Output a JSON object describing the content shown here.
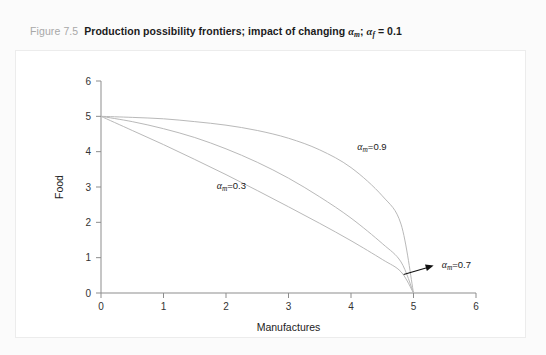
{
  "figure": {
    "number_label": "Figure 7.5",
    "caption_part1": "Production possibility frontiers; impact of changing ",
    "caption_alpha_m": "α",
    "caption_sub_m": "m",
    "caption_semicolon": "; ",
    "caption_alpha_f": "α",
    "caption_sub_f": "f",
    "caption_equals": " = 0.1"
  },
  "chart_data": {
    "type": "line",
    "title": "Production possibility frontiers; impact of changing αm; αf = 0.1",
    "xlabel": "Manufactures",
    "ylabel": "Food",
    "xlim": [
      0,
      6
    ],
    "ylim": [
      0,
      6
    ],
    "xticks": [
      0,
      1,
      2,
      3,
      4,
      5,
      6
    ],
    "yticks": [
      0,
      1,
      2,
      3,
      4,
      5,
      6
    ],
    "xtick_labels": [
      "0",
      "1",
      "2",
      "3",
      "4",
      "5",
      "6"
    ],
    "ytick_labels": [
      "0",
      "1",
      "2",
      "3",
      "4",
      "5",
      "6"
    ],
    "grid": false,
    "legend": "inline-annotations",
    "endpoints": {
      "y_intercept": 5,
      "x_intercept": 5
    },
    "series": [
      {
        "name": "αm=0.9",
        "label": "α",
        "label_sub": "m",
        "label_value": "=0.9",
        "curvature": "strongly concave to origin (outermost frontier)",
        "x": [
          0,
          0.5,
          1.0,
          1.5,
          2.0,
          2.5,
          3.0,
          3.5,
          4.0,
          4.5,
          4.8,
          5.0
        ],
        "y": [
          5.0,
          4.97,
          4.93,
          4.85,
          4.75,
          4.6,
          4.38,
          4.05,
          3.55,
          2.75,
          1.95,
          0.0
        ]
      },
      {
        "name": "αm=0.7",
        "label": "α",
        "label_sub": "m",
        "label_value": "=0.7",
        "curvature": "moderately concave to origin (middle frontier)",
        "x": [
          0,
          0.5,
          1.0,
          1.5,
          2.0,
          2.5,
          3.0,
          3.5,
          4.0,
          4.5,
          4.8,
          5.0
        ],
        "y": [
          5.0,
          4.85,
          4.65,
          4.4,
          4.08,
          3.7,
          3.25,
          2.72,
          2.12,
          1.4,
          0.88,
          0.0
        ]
      },
      {
        "name": "αm=0.3",
        "label": "α",
        "label_sub": "m",
        "label_value": "=0.3",
        "curvature": "nearly linear, slightly concave (innermost frontier)",
        "x": [
          0,
          0.5,
          1.0,
          1.5,
          2.0,
          2.5,
          3.0,
          3.5,
          4.0,
          4.5,
          4.8,
          5.0
        ],
        "y": [
          5.0,
          4.6,
          4.2,
          3.78,
          3.35,
          2.9,
          2.44,
          1.97,
          1.48,
          0.95,
          0.6,
          0.0
        ]
      }
    ],
    "annotations": [
      {
        "name": "alpha-m-09",
        "text": "αm=0.9",
        "x_data": 4.1,
        "y_data": 4.05
      },
      {
        "name": "alpha-m-03",
        "text": "αm=0.3",
        "x_data": 1.85,
        "y_data": 2.95
      },
      {
        "name": "alpha-m-07",
        "text": "αm=0.7",
        "x_data": 5.45,
        "y_data": 0.72,
        "arrow_to": [
          4.75,
          0.45
        ]
      }
    ]
  },
  "axes": {
    "x_title": "Manufactures",
    "y_title": "Food"
  }
}
